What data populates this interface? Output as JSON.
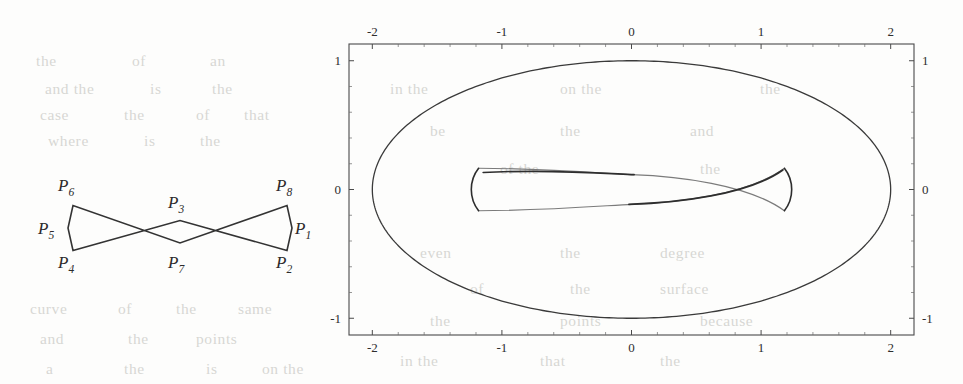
{
  "figure": {
    "title": "",
    "background_color": "#fdfdfc",
    "ink_color": "#2b2b2b"
  },
  "control_polygon": {
    "name": "control-polygon-diagram",
    "points": [
      {
        "id": "P1",
        "label": "P",
        "sub": "1",
        "label_x": 295,
        "label_y": 234,
        "vx": 292.0,
        "vy": 228.0
      },
      {
        "id": "P2",
        "label": "P",
        "sub": "2",
        "label_x": 276,
        "label_y": 268,
        "vx": 287.0,
        "vy": 250.5
      },
      {
        "id": "P3",
        "label": "P",
        "sub": "3",
        "label_x": 168,
        "label_y": 208,
        "vx": 180.0,
        "vy": 220.5
      },
      {
        "id": "P4",
        "label": "P",
        "sub": "4",
        "label_x": 58,
        "label_y": 268,
        "vx": 73.0,
        "vy": 250.5
      },
      {
        "id": "P5",
        "label": "P",
        "sub": "5",
        "label_x": 38,
        "label_y": 234,
        "vx": 68.0,
        "vy": 228.0
      },
      {
        "id": "P6",
        "label": "P",
        "sub": "6",
        "label_x": 58,
        "label_y": 191,
        "vx": 73.0,
        "vy": 205.5
      },
      {
        "id": "P7",
        "label": "P",
        "sub": "7",
        "label_x": 168,
        "label_y": 268,
        "vx": 180.0,
        "vy": 243.0
      },
      {
        "id": "P8",
        "label": "P",
        "sub": "8",
        "label_x": 276,
        "label_y": 191,
        "vx": 287.0,
        "vy": 205.5
      }
    ],
    "closed_path_order": [
      "P1",
      "P2",
      "P3",
      "P4",
      "P5",
      "P6",
      "P7",
      "P8"
    ],
    "stroke_color": "#333333",
    "stroke_width": 1.6
  },
  "chart_data": {
    "type": "line",
    "title": "",
    "xlabel": "",
    "ylabel": "",
    "xlim": [
      -2.18,
      2.18
    ],
    "ylim": [
      -1.13,
      1.13
    ],
    "xticks": [
      -2,
      -1,
      0,
      1,
      2
    ],
    "xticklabels": [
      "-2",
      "-1",
      "0",
      "1",
      "2"
    ],
    "yticks": [
      -1,
      0,
      1
    ],
    "yticklabels": [
      "-1",
      "0",
      "1"
    ],
    "ticks_on_all_sides": true,
    "grid": false,
    "legend": null,
    "frame": {
      "left": 349,
      "top": 44,
      "right": 914,
      "bottom": 335
    },
    "series": [
      {
        "name": "outer-ellipse",
        "kind": "ellipse",
        "center": [
          0,
          0
        ],
        "semi_axis_x": 2.0,
        "semi_axis_y": 1.0,
        "color": "#3a3a3a",
        "linewidth": 1.3
      },
      {
        "name": "inner-bowtie-envelope",
        "kind": "parametric-bowtie",
        "cusp_x": 1.18,
        "cusp_y_half": 0.165,
        "mid_half_height": 0.105,
        "color": "#3a3a3a",
        "linewidth": 1.2
      }
    ]
  },
  "background_text": {
    "visible": true,
    "note": "faint show-through of printed text from reverse page",
    "lines": [
      {
        "text": "the",
        "x": 36,
        "y": 52
      },
      {
        "text": "of",
        "x": 132,
        "y": 52
      },
      {
        "text": "an",
        "x": 210,
        "y": 52
      },
      {
        "text": "and the",
        "x": 45,
        "y": 80
      },
      {
        "text": "is",
        "x": 150,
        "y": 80
      },
      {
        "text": "the",
        "x": 212,
        "y": 80
      },
      {
        "text": "case",
        "x": 40,
        "y": 106
      },
      {
        "text": "the",
        "x": 124,
        "y": 106
      },
      {
        "text": "of",
        "x": 196,
        "y": 106
      },
      {
        "text": "that",
        "x": 244,
        "y": 106
      },
      {
        "text": "where",
        "x": 48,
        "y": 132
      },
      {
        "text": "is",
        "x": 144,
        "y": 132
      },
      {
        "text": "the",
        "x": 200,
        "y": 132
      },
      {
        "text": "curve",
        "x": 30,
        "y": 300
      },
      {
        "text": "of",
        "x": 118,
        "y": 300
      },
      {
        "text": "the",
        "x": 176,
        "y": 300
      },
      {
        "text": "same",
        "x": 238,
        "y": 300
      },
      {
        "text": "and",
        "x": 40,
        "y": 330
      },
      {
        "text": "the",
        "x": 128,
        "y": 330
      },
      {
        "text": "points",
        "x": 196,
        "y": 330
      },
      {
        "text": "a",
        "x": 46,
        "y": 360
      },
      {
        "text": "the",
        "x": 124,
        "y": 360
      },
      {
        "text": "is",
        "x": 206,
        "y": 360
      },
      {
        "text": "on the",
        "x": 262,
        "y": 360
      },
      {
        "text": "in the",
        "x": 390,
        "y": 80
      },
      {
        "text": "on the",
        "x": 560,
        "y": 80
      },
      {
        "text": "the",
        "x": 760,
        "y": 80
      },
      {
        "text": "be",
        "x": 430,
        "y": 122
      },
      {
        "text": "the",
        "x": 560,
        "y": 122
      },
      {
        "text": "and",
        "x": 690,
        "y": 122
      },
      {
        "text": "of the",
        "x": 500,
        "y": 160
      },
      {
        "text": "the",
        "x": 700,
        "y": 160
      },
      {
        "text": "even",
        "x": 420,
        "y": 244
      },
      {
        "text": "the",
        "x": 560,
        "y": 244
      },
      {
        "text": "degree",
        "x": 660,
        "y": 244
      },
      {
        "text": "of",
        "x": 470,
        "y": 280
      },
      {
        "text": "the",
        "x": 570,
        "y": 280
      },
      {
        "text": "surface",
        "x": 660,
        "y": 280
      },
      {
        "text": "the",
        "x": 430,
        "y": 312
      },
      {
        "text": "points",
        "x": 560,
        "y": 312
      },
      {
        "text": "because",
        "x": 700,
        "y": 312
      },
      {
        "text": "in the",
        "x": 400,
        "y": 352
      },
      {
        "text": "that",
        "x": 540,
        "y": 352
      },
      {
        "text": "the",
        "x": 660,
        "y": 352
      }
    ]
  }
}
